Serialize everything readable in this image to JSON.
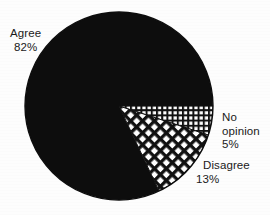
{
  "chart_data": {
    "type": "pie",
    "title": "",
    "categories": [
      "Agree",
      "No opinion",
      "Disagree"
    ],
    "values": [
      82,
      5,
      13
    ],
    "value_labels": [
      "82%",
      "5%",
      "13%"
    ],
    "slices": [
      {
        "label": "Agree",
        "value": 82,
        "value_label": "82%",
        "fill": "solid-black",
        "color": "#0d0d0d",
        "start_angle_deg": 64.8,
        "end_angle_deg": 360
      },
      {
        "label": "No opinion",
        "value": 5,
        "value_label": "5%",
        "fill": "fine-orthogonal-grid",
        "color": "#101010",
        "start_angle_deg": 0,
        "end_angle_deg": 18
      },
      {
        "label": "Disagree",
        "value": 13,
        "value_label": "13%",
        "fill": "diagonal-crosshatch",
        "color": "#101010",
        "start_angle_deg": 18,
        "end_angle_deg": 64.8
      }
    ],
    "total": 100,
    "units": "percent",
    "legend": "none",
    "labels_position": "outside-callout",
    "grid": false,
    "background_color": "#fdfdfd",
    "text_color": "#1a1a1a"
  },
  "labels": {
    "agree": {
      "name": "Agree",
      "percent": "82%"
    },
    "no_opinion": {
      "line1": "No",
      "line2": "opinion",
      "percent": "5%"
    },
    "disagree": {
      "name": "Disagree",
      "percent": "13%"
    }
  }
}
